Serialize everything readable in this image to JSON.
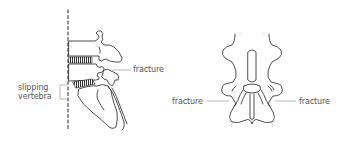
{
  "figure": {
    "lateral_view": {
      "labels": {
        "fracture": "fracture",
        "slipping_line1": "slipping",
        "slipping_line2": "vertebra"
      }
    },
    "posterior_view": {
      "labels": {
        "fracture_left": "fracture",
        "fracture_right": "fracture"
      }
    },
    "colors": {
      "line": "#222222",
      "label": "#555555",
      "leader": "#888888",
      "disc": "#333333"
    }
  }
}
